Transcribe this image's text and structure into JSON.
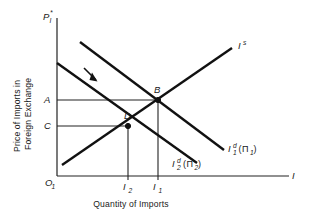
{
  "figure": {
    "type": "economics-diagram",
    "axes": {
      "y_axis_symbol": {
        "base": "P",
        "sub": "I",
        "sup": "*"
      },
      "y_axis_title_line1": "Price of Imports in",
      "y_axis_title_line2": "Foreign Exchange",
      "x_axis_title": "Quantity of Imports",
      "x_axis_symbol": "I",
      "origin_label": {
        "base": "O",
        "sub": "1"
      }
    },
    "price_ticks": [
      {
        "id": "tick-A",
        "label": "A",
        "value_y": 100
      },
      {
        "id": "tick-C",
        "label": "C",
        "value_y": 126
      }
    ],
    "quantity_ticks": [
      {
        "id": "tick-I2",
        "base": "I",
        "sub": "2",
        "value_x": 128
      },
      {
        "id": "tick-I1",
        "base": "I",
        "sub": "1",
        "value_x": 158
      }
    ],
    "curves": [
      {
        "id": "supply",
        "label": {
          "base": "I",
          "sup": "s",
          "sub": "",
          "paren": ""
        },
        "kind": "supply",
        "from": [
          62,
          165
        ],
        "to": [
          232,
          48
        ]
      },
      {
        "id": "demand-1",
        "label": {
          "base": "I",
          "sub": "1",
          "sup": "d",
          "paren": "(Π1)"
        },
        "kind": "demand",
        "from": [
          80,
          42
        ],
        "to": [
          224,
          150
        ]
      },
      {
        "id": "demand-2",
        "label": {
          "base": "I",
          "sub": "2",
          "sup": "d",
          "paren": "(Π2)"
        },
        "kind": "demand",
        "from": [
          57,
          63
        ],
        "to": [
          197,
          163
        ]
      }
    ],
    "points": [
      {
        "id": "point-B",
        "label": "B",
        "x": 158,
        "y": 100
      },
      {
        "id": "point-D",
        "label": "D",
        "x": 128,
        "y": 126
      }
    ],
    "annotation": {
      "id": "shift-arrow",
      "meaning": "leftward-shift-of-import-demand"
    },
    "curve_labels": {
      "supply": {
        "base": "I",
        "sup": "s"
      },
      "demand1": {
        "base": "I",
        "sub": "1",
        "sup": "d",
        "paren_open": "(",
        "pi": "Π",
        "pi_sub": "1",
        "paren_close": ")"
      },
      "demand2": {
        "base": "I",
        "sub": "2",
        "sup": "d",
        "paren_open": "(",
        "pi": "Π",
        "pi_sub": "2",
        "paren_close": ")"
      }
    },
    "colors": {
      "stroke": "#111111",
      "background": "#ffffff"
    }
  }
}
